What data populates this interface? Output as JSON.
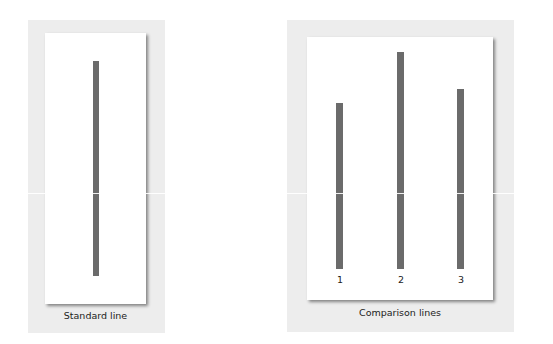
{
  "standard_panel": {
    "caption": "Standard line",
    "line": {
      "length_px": 215
    }
  },
  "comparison_panel": {
    "caption": "Comparison lines",
    "lines": [
      {
        "label": "1",
        "length_px": 166
      },
      {
        "label": "2",
        "length_px": 217
      },
      {
        "label": "3",
        "length_px": 180
      }
    ]
  },
  "colors": {
    "line": "#6b6b6b",
    "panel_background": "#ededed",
    "card": "#ffffff"
  }
}
